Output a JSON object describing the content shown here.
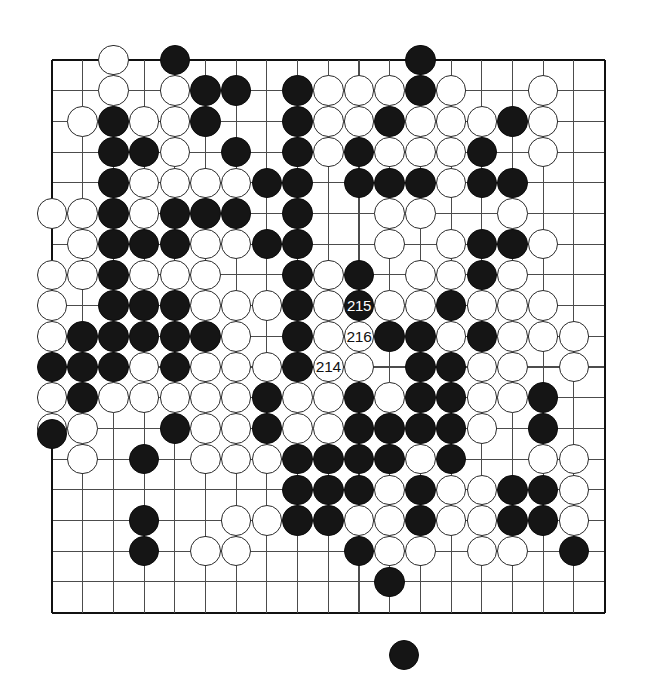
{
  "diagram": {
    "kind": "go-board-diagram",
    "board_size": 19,
    "columns": 19,
    "rows": 19,
    "geometry": {
      "left": 52,
      "top": 60,
      "spacing": 30.7,
      "stone_diameter": 30.5,
      "line_color": "#4c4c4c",
      "edge_color": "#111111",
      "black_color": "#151515",
      "white_color": "#ffffff",
      "background": "#ffffff"
    },
    "star_points": []
  },
  "move_labels": [
    {
      "number": "214",
      "color": "white",
      "col": 10,
      "row": 11
    },
    {
      "number": "215",
      "color": "black",
      "col": 11,
      "row": 9
    },
    {
      "number": "216",
      "color": "white",
      "col": 11,
      "row": 10
    }
  ],
  "off_board_stones": [
    {
      "color": "black",
      "x": 52,
      "y": 434,
      "note": "captured-stone-left-margin"
    },
    {
      "color": "black",
      "x": 404,
      "y": 655,
      "note": "captured-stone-bottom-margin"
    }
  ],
  "stones": {
    "black": [
      [
        5,
        1
      ],
      [
        13,
        1
      ],
      [
        6,
        2
      ],
      [
        7,
        2
      ],
      [
        9,
        2
      ],
      [
        13,
        2
      ],
      [
        3,
        3
      ],
      [
        6,
        3
      ],
      [
        9,
        3
      ],
      [
        12,
        3
      ],
      [
        16,
        3
      ],
      [
        3,
        4
      ],
      [
        4,
        4
      ],
      [
        7,
        4
      ],
      [
        9,
        4
      ],
      [
        11,
        4
      ],
      [
        15,
        4
      ],
      [
        3,
        5
      ],
      [
        8,
        5
      ],
      [
        9,
        5
      ],
      [
        11,
        5
      ],
      [
        12,
        5
      ],
      [
        13,
        5
      ],
      [
        15,
        5
      ],
      [
        16,
        5
      ],
      [
        3,
        6
      ],
      [
        5,
        6
      ],
      [
        6,
        6
      ],
      [
        7,
        6
      ],
      [
        9,
        6
      ],
      [
        3,
        7
      ],
      [
        4,
        7
      ],
      [
        5,
        7
      ],
      [
        8,
        7
      ],
      [
        9,
        7
      ],
      [
        15,
        7
      ],
      [
        16,
        7
      ],
      [
        3,
        8
      ],
      [
        9,
        8
      ],
      [
        11,
        8
      ],
      [
        15,
        8
      ],
      [
        3,
        9
      ],
      [
        4,
        9
      ],
      [
        5,
        9
      ],
      [
        9,
        9
      ],
      [
        11,
        9
      ],
      [
        14,
        9
      ],
      [
        2,
        10
      ],
      [
        3,
        10
      ],
      [
        4,
        10
      ],
      [
        5,
        10
      ],
      [
        6,
        10
      ],
      [
        9,
        10
      ],
      [
        12,
        10
      ],
      [
        13,
        10
      ],
      [
        15,
        10
      ],
      [
        1,
        11
      ],
      [
        2,
        11
      ],
      [
        3,
        11
      ],
      [
        5,
        11
      ],
      [
        9,
        11
      ],
      [
        13,
        11
      ],
      [
        14,
        11
      ],
      [
        2,
        12
      ],
      [
        8,
        12
      ],
      [
        11,
        12
      ],
      [
        13,
        12
      ],
      [
        14,
        12
      ],
      [
        17,
        12
      ],
      [
        5,
        13
      ],
      [
        8,
        13
      ],
      [
        11,
        13
      ],
      [
        12,
        13
      ],
      [
        13,
        13
      ],
      [
        14,
        13
      ],
      [
        17,
        13
      ],
      [
        4,
        14
      ],
      [
        9,
        14
      ],
      [
        10,
        14
      ],
      [
        11,
        14
      ],
      [
        12,
        14
      ],
      [
        14,
        14
      ],
      [
        9,
        15
      ],
      [
        10,
        15
      ],
      [
        11,
        15
      ],
      [
        13,
        15
      ],
      [
        16,
        15
      ],
      [
        17,
        15
      ],
      [
        4,
        16
      ],
      [
        9,
        16
      ],
      [
        10,
        16
      ],
      [
        13,
        16
      ],
      [
        16,
        16
      ],
      [
        17,
        16
      ],
      [
        4,
        17
      ],
      [
        11,
        17
      ],
      [
        18,
        17
      ],
      [
        12,
        18
      ]
    ],
    "white": [
      [
        3,
        1
      ],
      [
        3,
        2
      ],
      [
        5,
        2
      ],
      [
        10,
        2
      ],
      [
        11,
        2
      ],
      [
        12,
        2
      ],
      [
        14,
        2
      ],
      [
        17,
        2
      ],
      [
        2,
        3
      ],
      [
        4,
        3
      ],
      [
        5,
        3
      ],
      [
        10,
        3
      ],
      [
        11,
        3
      ],
      [
        13,
        3
      ],
      [
        14,
        3
      ],
      [
        15,
        3
      ],
      [
        17,
        3
      ],
      [
        5,
        4
      ],
      [
        10,
        4
      ],
      [
        12,
        4
      ],
      [
        13,
        4
      ],
      [
        14,
        4
      ],
      [
        17,
        4
      ],
      [
        4,
        5
      ],
      [
        5,
        5
      ],
      [
        6,
        5
      ],
      [
        7,
        5
      ],
      [
        14,
        5
      ],
      [
        1,
        6
      ],
      [
        2,
        6
      ],
      [
        4,
        6
      ],
      [
        12,
        6
      ],
      [
        13,
        6
      ],
      [
        16,
        6
      ],
      [
        2,
        7
      ],
      [
        6,
        7
      ],
      [
        7,
        7
      ],
      [
        12,
        7
      ],
      [
        14,
        7
      ],
      [
        17,
        7
      ],
      [
        1,
        8
      ],
      [
        2,
        8
      ],
      [
        4,
        8
      ],
      [
        5,
        8
      ],
      [
        6,
        8
      ],
      [
        10,
        8
      ],
      [
        13,
        8
      ],
      [
        14,
        8
      ],
      [
        16,
        8
      ],
      [
        1,
        9
      ],
      [
        6,
        9
      ],
      [
        7,
        9
      ],
      [
        8,
        9
      ],
      [
        10,
        9
      ],
      [
        12,
        9
      ],
      [
        13,
        9
      ],
      [
        15,
        9
      ],
      [
        16,
        9
      ],
      [
        17,
        9
      ],
      [
        1,
        10
      ],
      [
        7,
        10
      ],
      [
        10,
        10
      ],
      [
        11,
        10
      ],
      [
        14,
        10
      ],
      [
        16,
        10
      ],
      [
        17,
        10
      ],
      [
        18,
        10
      ],
      [
        4,
        11
      ],
      [
        6,
        11
      ],
      [
        7,
        11
      ],
      [
        8,
        11
      ],
      [
        11,
        11
      ],
      [
        15,
        11
      ],
      [
        16,
        11
      ],
      [
        18,
        11
      ],
      [
        1,
        12
      ],
      [
        3,
        12
      ],
      [
        4,
        12
      ],
      [
        5,
        12
      ],
      [
        6,
        12
      ],
      [
        7,
        12
      ],
      [
        9,
        12
      ],
      [
        10,
        12
      ],
      [
        12,
        12
      ],
      [
        15,
        12
      ],
      [
        16,
        12
      ],
      [
        1,
        13
      ],
      [
        2,
        13
      ],
      [
        6,
        13
      ],
      [
        7,
        13
      ],
      [
        9,
        13
      ],
      [
        10,
        13
      ],
      [
        15,
        13
      ],
      [
        2,
        14
      ],
      [
        6,
        14
      ],
      [
        7,
        14
      ],
      [
        8,
        14
      ],
      [
        13,
        14
      ],
      [
        17,
        14
      ],
      [
        18,
        14
      ],
      [
        12,
        15
      ],
      [
        14,
        15
      ],
      [
        15,
        15
      ],
      [
        18,
        15
      ],
      [
        7,
        16
      ],
      [
        8,
        16
      ],
      [
        11,
        16
      ],
      [
        12,
        16
      ],
      [
        14,
        16
      ],
      [
        15,
        16
      ],
      [
        18,
        16
      ],
      [
        6,
        17
      ],
      [
        7,
        17
      ],
      [
        12,
        17
      ],
      [
        13,
        17
      ],
      [
        15,
        17
      ],
      [
        16,
        17
      ]
    ]
  }
}
